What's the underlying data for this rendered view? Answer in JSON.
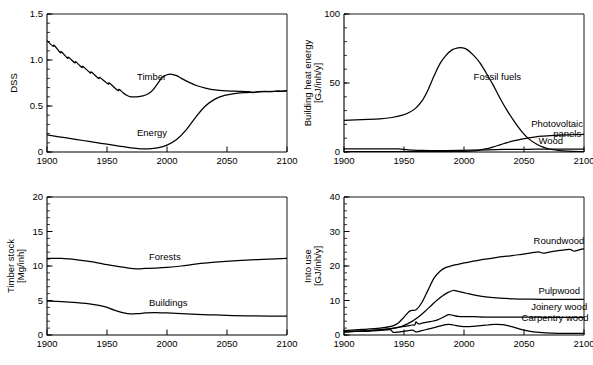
{
  "figure": {
    "background": "#ffffff",
    "line_color": "#000000",
    "panel_count": 4
  },
  "chart_data": [
    {
      "id": "dss",
      "type": "line",
      "position": "top-left",
      "title": "",
      "xlabel": "",
      "ylabel": "DSS",
      "xlim": [
        1900,
        2100
      ],
      "ylim": [
        0,
        1.5
      ],
      "xticks": [
        1900,
        1950,
        2000,
        2050,
        2100
      ],
      "xticklabels": [
        "1900",
        "1950",
        "2000",
        "2050",
        "2100"
      ],
      "yticks": [
        0,
        0.5,
        1.0,
        1.5
      ],
      "yticklabels": [
        "0",
        "0.5",
        "1.0",
        "1.5"
      ],
      "yminor_step": 0.1,
      "grid": false,
      "legend": "inline-annotations",
      "series": [
        {
          "name": "Timber",
          "label_x": 1975,
          "label_y": 0.78,
          "x": [
            1900,
            1905,
            1906,
            1911,
            1912,
            1917,
            1918,
            1923,
            1924,
            1929,
            1930,
            1936,
            1937,
            1943,
            1944,
            1951,
            1952,
            1959,
            1960,
            1963,
            1966,
            1970,
            1975,
            1980,
            1984,
            1988,
            1992,
            1996,
            2000,
            2004,
            2008,
            2012,
            2018,
            2025,
            2032,
            2040,
            2050,
            2060,
            2068,
            2072,
            2076,
            2082,
            2088,
            2092,
            2096,
            2100
          ],
          "y": [
            1.21,
            1.15,
            1.16,
            1.08,
            1.09,
            1.02,
            1.03,
            0.97,
            0.98,
            0.92,
            0.93,
            0.86,
            0.87,
            0.8,
            0.81,
            0.74,
            0.75,
            0.67,
            0.68,
            0.65,
            0.62,
            0.6,
            0.6,
            0.61,
            0.63,
            0.67,
            0.74,
            0.81,
            0.84,
            0.845,
            0.83,
            0.8,
            0.76,
            0.72,
            0.695,
            0.675,
            0.665,
            0.66,
            0.655,
            0.645,
            0.655,
            0.66,
            0.655,
            0.665,
            0.66,
            0.665
          ]
        },
        {
          "name": "Energy",
          "label_x": 1975,
          "label_y": 0.17,
          "x": [
            1900,
            1910,
            1920,
            1930,
            1940,
            1950,
            1960,
            1970,
            1978,
            1985,
            1992,
            2000,
            2008,
            2016,
            2024,
            2032,
            2040,
            2048,
            2056,
            2064,
            2072,
            2080,
            2088,
            2094,
            2100
          ],
          "y": [
            0.185,
            0.165,
            0.145,
            0.125,
            0.105,
            0.085,
            0.065,
            0.045,
            0.035,
            0.035,
            0.045,
            0.075,
            0.135,
            0.24,
            0.38,
            0.5,
            0.575,
            0.615,
            0.635,
            0.645,
            0.65,
            0.655,
            0.66,
            0.66,
            0.665
          ]
        }
      ]
    },
    {
      "id": "building-heat-energy",
      "type": "line",
      "position": "top-right",
      "title": "",
      "xlabel": "",
      "ylabel": "Building heat energy [GJ/inh/y]",
      "ylabel_line1": "Building heat energy",
      "ylabel_line2": "[GJ/inh/y]",
      "xlim": [
        1900,
        2100
      ],
      "ylim": [
        0,
        100
      ],
      "xticks": [
        1900,
        1950,
        2000,
        2050,
        2100
      ],
      "xticklabels": [
        "1900",
        "1950",
        "2000",
        "2050",
        "2100"
      ],
      "yticks": [
        0,
        50,
        100
      ],
      "yticklabels": [
        "0",
        "50",
        "100"
      ],
      "yminor_step": 10,
      "grid": false,
      "legend": "inline-annotations",
      "series": [
        {
          "name": "Fossil fuels",
          "label_x": 2008,
          "label_y": 52,
          "x": [
            1900,
            1915,
            1930,
            1940,
            1948,
            1955,
            1960,
            1965,
            1970,
            1975,
            1980,
            1985,
            1990,
            1995,
            1999,
            2003,
            2008,
            2013,
            2018,
            2024,
            2030,
            2036,
            2042,
            2048,
            2054,
            2060,
            2066,
            2072,
            2080,
            2090,
            2100
          ],
          "y": [
            23,
            23.5,
            24,
            25,
            26.5,
            29,
            32,
            37,
            45,
            55,
            64,
            70,
            74,
            75.5,
            75.5,
            74,
            70,
            65,
            58,
            49,
            39,
            30,
            22,
            15,
            9.5,
            6,
            3.5,
            2,
            1,
            0.5,
            0.3
          ]
        },
        {
          "name": "Photovoltaic panels",
          "label_x": 2056,
          "label_y": 18,
          "label_line1": "Photovoltaic",
          "label_line2": "panels",
          "x": [
            1900,
            1950,
            1980,
            1995,
            2005,
            2012,
            2018,
            2024,
            2030,
            2036,
            2042,
            2048,
            2054,
            2060,
            2066,
            2072,
            2080,
            2090,
            2100
          ],
          "y": [
            0.2,
            0.2,
            0.2,
            0.3,
            0.6,
            1.2,
            2.2,
            3.6,
            5.2,
            6.8,
            8.2,
            9.4,
            10.3,
            11.0,
            11.5,
            11.9,
            12.2,
            12.5,
            12.7
          ]
        },
        {
          "name": "Wood",
          "label_x": 2062,
          "label_y": 6,
          "x": [
            1900,
            1930,
            1945,
            1952,
            1958,
            1965,
            1975,
            1985,
            1995,
            2005,
            2020,
            2040,
            2060,
            2080,
            2100
          ],
          "y": [
            2.3,
            2.3,
            2.2,
            1.7,
            1.3,
            1.1,
            1.0,
            1.0,
            1.1,
            1.3,
            1.6,
            1.9,
            2.0,
            2.1,
            2.1
          ]
        }
      ]
    },
    {
      "id": "timber-stock",
      "type": "line",
      "position": "bottom-left",
      "title": "",
      "xlabel": "",
      "ylabel": "Timber stock [Mg/inh]",
      "ylabel_line1": "Timber stock",
      "ylabel_line2": "[Mg/inh]",
      "xlim": [
        1900,
        2100
      ],
      "ylim": [
        0,
        20
      ],
      "xticks": [
        1900,
        1950,
        2000,
        2050,
        2100
      ],
      "xticklabels": [
        "1900",
        "1950",
        "2000",
        "2050",
        "2100"
      ],
      "yticks": [
        0,
        5,
        10,
        15,
        20
      ],
      "yticklabels": [
        "0",
        "5",
        "10",
        "15",
        "20"
      ],
      "yminor_step": 1,
      "grid": false,
      "legend": "inline-annotations",
      "series": [
        {
          "name": "Forests",
          "label_x": 1985,
          "label_y": 10.9,
          "x": [
            1900,
            1912,
            1925,
            1938,
            1950,
            1960,
            1968,
            1975,
            1982,
            1990,
            2000,
            2012,
            2025,
            2040,
            2055,
            2070,
            2085,
            2100
          ],
          "y": [
            11.1,
            11.1,
            10.9,
            10.6,
            10.2,
            9.9,
            9.7,
            9.6,
            9.65,
            9.7,
            9.8,
            10.0,
            10.3,
            10.55,
            10.75,
            10.9,
            11.0,
            11.1
          ]
        },
        {
          "name": "Buildings",
          "label_x": 1985,
          "label_y": 4.2,
          "x": [
            1900,
            1912,
            1925,
            1938,
            1948,
            1956,
            1964,
            1970,
            1976,
            1982,
            1990,
            2000,
            2012,
            2025,
            2040,
            2055,
            2070,
            2085,
            2100
          ],
          "y": [
            4.9,
            4.85,
            4.7,
            4.45,
            4.1,
            3.6,
            3.2,
            3.05,
            3.1,
            3.2,
            3.25,
            3.2,
            3.1,
            3.0,
            2.9,
            2.82,
            2.78,
            2.75,
            2.75
          ]
        }
      ]
    },
    {
      "id": "into-use",
      "type": "line",
      "position": "bottom-right",
      "title": "",
      "xlabel": "",
      "ylabel": "Into use [GJ/inh/y]",
      "ylabel_line1": "Into use",
      "ylabel_line2": "[GJ/inh/y]",
      "xlim": [
        1900,
        2100
      ],
      "ylim": [
        0,
        40
      ],
      "xticks": [
        1900,
        1950,
        2000,
        2050,
        2100
      ],
      "xticklabels": [
        "1900",
        "1950",
        "2000",
        "2050",
        "2100"
      ],
      "yticks": [
        0,
        10,
        20,
        30,
        40
      ],
      "yticklabels": [
        "0",
        "10",
        "20",
        "30",
        "40"
      ],
      "yminor_step": 2,
      "grid": false,
      "legend": "inline-annotations",
      "series": [
        {
          "name": "Roundwood",
          "label_x": 2058,
          "label_y": 26.5,
          "x": [
            1900,
            1915,
            1930,
            1940,
            1945,
            1950,
            1955,
            1960,
            1965,
            1970,
            1975,
            1980,
            1985,
            1990,
            1995,
            2000,
            2008,
            2016,
            2024,
            2032,
            2040,
            2048,
            2056,
            2062,
            2066,
            2072,
            2080,
            2088,
            2092,
            2096,
            2100
          ],
          "y": [
            1.3,
            1.6,
            2.0,
            2.6,
            3.4,
            5.2,
            7.0,
            7.3,
            9.5,
            13.0,
            16.5,
            18.5,
            19.6,
            20.1,
            20.5,
            20.9,
            21.4,
            21.9,
            22.3,
            22.7,
            23.0,
            23.4,
            23.8,
            24.1,
            23.7,
            24.1,
            24.5,
            24.8,
            24.3,
            24.7,
            25.0
          ]
        },
        {
          "name": "Pulpwood",
          "label_x": 2062,
          "label_y": 12.0,
          "x": [
            1900,
            1920,
            1935,
            1945,
            1950,
            1956,
            1962,
            1968,
            1974,
            1980,
            1986,
            1991,
            1996,
            2002,
            2010,
            2020,
            2030,
            2042,
            2055,
            2070,
            2085,
            2100
          ],
          "y": [
            0.9,
            1.2,
            1.6,
            2.2,
            2.8,
            3.8,
            5.2,
            7.0,
            9.0,
            10.8,
            12.2,
            12.9,
            12.6,
            12.1,
            11.5,
            11.0,
            10.7,
            10.5,
            10.4,
            10.3,
            10.3,
            10.3
          ]
        },
        {
          "name": "Joinery wood",
          "label_x": 2056,
          "label_y": 7.2,
          "x": [
            1900,
            1920,
            1935,
            1945,
            1952,
            1957,
            1959,
            1960,
            1962,
            1966,
            1972,
            1978,
            1983,
            1987,
            1991,
            1995,
            2000,
            2008,
            2018,
            2030,
            2045,
            2060,
            2075,
            2090,
            2100
          ],
          "y": [
            0.9,
            1.3,
            1.7,
            2.2,
            2.6,
            2.9,
            2.9,
            3.8,
            3.2,
            3.5,
            3.9,
            4.4,
            5.2,
            5.9,
            5.7,
            5.4,
            5.3,
            5.3,
            5.2,
            5.2,
            5.15,
            5.15,
            5.1,
            5.1,
            5.1
          ]
        },
        {
          "name": "Carpentry wood",
          "label_x": 2048,
          "label_y": 4.0,
          "x": [
            1900,
            1915,
            1928,
            1936,
            1939,
            1941,
            1944,
            1948,
            1952,
            1957,
            1960,
            1964,
            1970,
            1976,
            1982,
            1987,
            1991,
            1996,
            2002,
            2008,
            2014,
            2020,
            2026,
            2032,
            2038,
            2044,
            2050,
            2058,
            2068,
            2080,
            2090,
            2100
          ],
          "y": [
            0.9,
            1.1,
            1.3,
            1.5,
            1.5,
            0.8,
            0.8,
            1.0,
            1.2,
            1.4,
            0.9,
            1.2,
            1.7,
            2.2,
            2.8,
            3.1,
            2.9,
            2.6,
            2.4,
            2.5,
            2.7,
            2.9,
            3.1,
            3.0,
            2.6,
            2.0,
            1.4,
            0.9,
            0.6,
            0.5,
            0.5,
            0.5
          ]
        }
      ]
    }
  ]
}
